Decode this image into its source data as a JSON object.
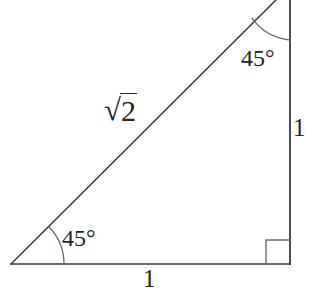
{
  "figure": {
    "background_color": "#ffffff",
    "stroke_color": "#3a3a3a",
    "text_color": "#262626",
    "labels": {
      "hypotenuse_radical": "√",
      "hypotenuse_radicand": "2",
      "vertical_side": "1",
      "base_side": "1",
      "angle_bottom_left": "45°",
      "angle_top_right": "45°"
    },
    "geometry": {
      "vertex_bottom_left": [
        11,
        264
      ],
      "vertex_bottom_right": [
        290,
        264
      ],
      "vertex_top_right": [
        290,
        -14
      ],
      "base_length_px": 279,
      "vertical_length_px": 278,
      "arc_radius_bottom_left_px": 53,
      "arc_radius_top_right_px": 54,
      "right_angle_marker_size_px": 24
    }
  }
}
